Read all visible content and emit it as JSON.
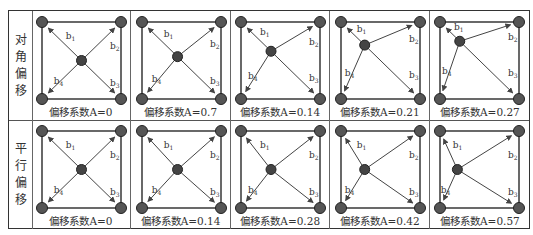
{
  "figure": {
    "rows": [
      {
        "label": [
          "对",
          "角",
          "偏",
          "移"
        ],
        "name": "diagonal-offset",
        "cells": [
          {
            "caption": "偏移系数A=0",
            "A": "0",
            "cx": 0.5,
            "cy": 0.5
          },
          {
            "caption": "偏移系数A=0.7",
            "A": "0.7",
            "cx": 0.45,
            "cy": 0.45
          },
          {
            "caption": "偏移系数A=0.14",
            "A": "0.14",
            "cx": 0.38,
            "cy": 0.38
          },
          {
            "caption": "偏移系数A=0.21",
            "A": "0.21",
            "cx": 0.3,
            "cy": 0.3
          },
          {
            "caption": "偏移系数A=0.27",
            "A": "0.27",
            "cx": 0.25,
            "cy": 0.25
          }
        ]
      },
      {
        "label": [
          "平",
          "行",
          "偏",
          "移"
        ],
        "name": "parallel-offset",
        "cells": [
          {
            "caption": "偏移系数A=0",
            "A": "0",
            "cx": 0.5,
            "cy": 0.5
          },
          {
            "caption": "偏移系数A=0.14",
            "A": "0.14",
            "cx": 0.45,
            "cy": 0.5
          },
          {
            "caption": "偏移系数A=0.28",
            "A": "0.28",
            "cx": 0.38,
            "cy": 0.5
          },
          {
            "caption": "偏移系数A=0.42",
            "A": "0.42",
            "cx": 0.3,
            "cy": 0.5
          },
          {
            "caption": "偏移系数A=0.57",
            "A": "0.57",
            "cx": 0.22,
            "cy": 0.5
          }
        ]
      }
    ],
    "vector_labels": [
      "b1",
      "b2",
      "b3",
      "b4"
    ],
    "colors": {
      "node": "#555555",
      "node_stroke": "#222222",
      "line": "#444444",
      "text": "#333333"
    }
  }
}
